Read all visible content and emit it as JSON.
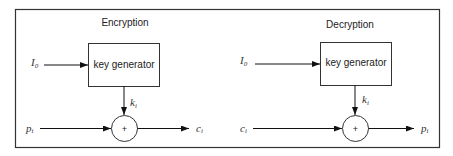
{
  "diagram": {
    "encryption": {
      "title": "Encryption",
      "block_label": "key generator",
      "iv_label": "I",
      "iv_sub": "0",
      "key_label": "k",
      "key_sub": "i",
      "input_label": "p",
      "input_sub": "i",
      "output_label": "c",
      "output_sub": "i",
      "op_symbol": "+"
    },
    "decryption": {
      "title": "Decryption",
      "block_label": "key generator",
      "iv_label": "I",
      "iv_sub": "0",
      "key_label": "k",
      "key_sub": "i",
      "input_label": "c",
      "input_sub": "i",
      "output_label": "p",
      "output_sub": "i",
      "op_symbol": "+"
    }
  }
}
